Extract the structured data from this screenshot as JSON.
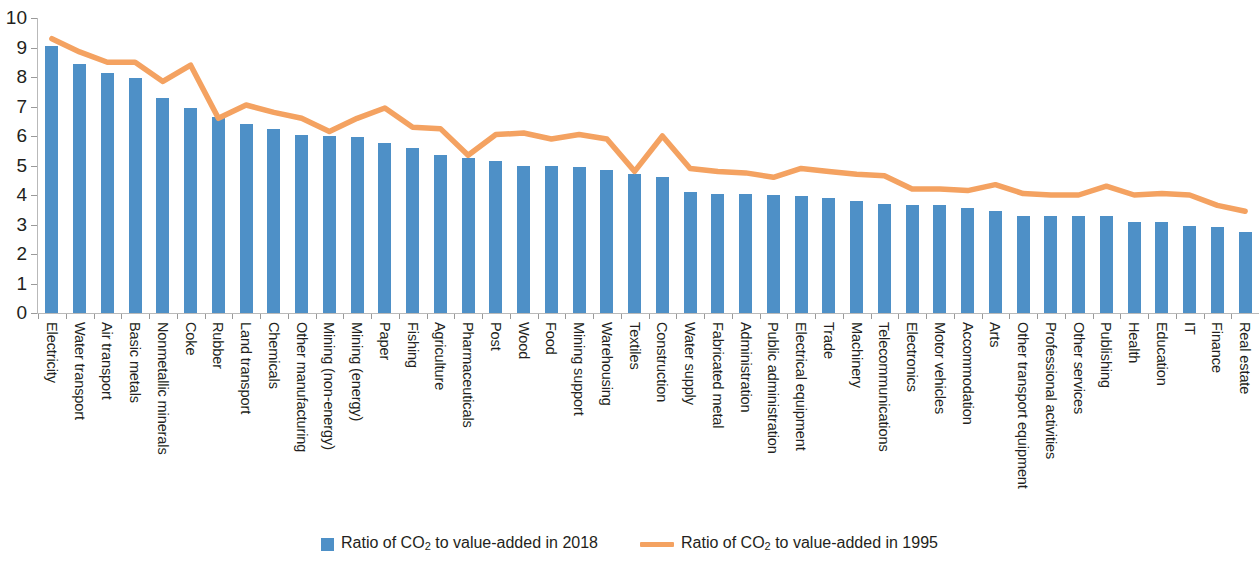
{
  "chart_data": {
    "type": "bar",
    "title": "",
    "subtitle": "",
    "xlabel": "",
    "ylabel": "",
    "ylim": [
      0,
      10
    ],
    "y_ticks": [
      0,
      1,
      2,
      3,
      4,
      5,
      6,
      7,
      8,
      9,
      10
    ],
    "grid": false,
    "legend_position": "bottom-center",
    "categories": [
      "Electricity",
      "Water transport",
      "Air transport",
      "Basic metals",
      "Nonmetallic minerals",
      "Coke",
      "Rubber",
      "Land transport",
      "Chemicals",
      "Other manufacturing",
      "Mining (non-energy)",
      "Mining (energy)",
      "Paper",
      "Fishing",
      "Agriculture",
      "Pharmaceuticals",
      "Post",
      "Wood",
      "Food",
      "Mining support",
      "Warehousing",
      "Textiles",
      "Construction",
      "Water supply",
      "Fabricated metal",
      "Administration",
      "Public administration",
      "Electrical equipment",
      "Trade",
      "Machinery",
      "Telecommunications",
      "Electronics",
      "Motor vehicles",
      "Accommodation",
      "Arts",
      "Other transport equipment",
      "Professional activities",
      "Other services",
      "Publishing",
      "Health",
      "Education",
      "IT",
      "Finance",
      "Real estate"
    ],
    "series": [
      {
        "name": "Ratio of CO2 to value-added in 2018",
        "type": "bar",
        "color": "#4e90c7",
        "values": [
          9.05,
          8.45,
          8.15,
          7.95,
          7.3,
          6.95,
          6.65,
          6.4,
          6.25,
          6.05,
          6.0,
          5.95,
          5.75,
          5.6,
          5.35,
          5.25,
          5.15,
          5.0,
          5.0,
          4.95,
          4.85,
          4.7,
          4.6,
          4.1,
          4.05,
          4.05,
          4.0,
          3.95,
          3.9,
          3.8,
          3.7,
          3.65,
          3.65,
          3.55,
          3.45,
          3.3,
          3.3,
          3.3,
          3.3,
          3.1,
          3.1,
          2.95,
          2.9,
          2.75
        ]
      },
      {
        "name": "Ratio of CO2 to value-added in 1995",
        "type": "line",
        "color": "#f4a261",
        "values": [
          9.3,
          8.85,
          8.5,
          8.5,
          7.85,
          8.4,
          6.6,
          7.05,
          6.8,
          6.6,
          6.15,
          6.6,
          6.95,
          6.3,
          6.25,
          5.35,
          6.05,
          6.1,
          5.9,
          6.05,
          5.9,
          4.8,
          6.0,
          4.9,
          4.8,
          4.75,
          4.6,
          4.9,
          4.8,
          4.7,
          4.65,
          4.2,
          4.2,
          4.15,
          4.35,
          4.05,
          4.0,
          4.0,
          4.3,
          4.0,
          4.05,
          4.0,
          3.65,
          3.45
        ]
      }
    ]
  },
  "legend": {
    "items": [
      {
        "label_pre": "Ratio of CO",
        "label_sub": "2",
        "label_post": " to value-added in 2018",
        "marker": "bar-swatch",
        "color": "#4e90c7"
      },
      {
        "label_pre": "Ratio of CO",
        "label_sub": "2",
        "label_post": " to value-added in 1995",
        "marker": "line-swatch",
        "color": "#f4a261"
      }
    ]
  }
}
